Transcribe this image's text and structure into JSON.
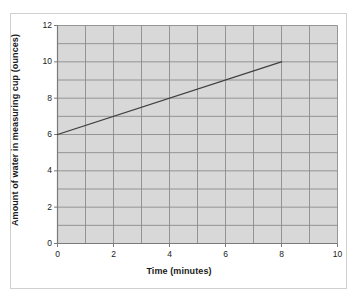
{
  "chart_data": {
    "type": "line",
    "title": "",
    "xlabel": "Time (minutes)",
    "ylabel": "Amount of water in measuring cup (ounces)",
    "xlim": [
      0,
      10
    ],
    "ylim": [
      0,
      12
    ],
    "x_ticks": [
      0,
      2,
      4,
      6,
      8,
      10
    ],
    "y_ticks": [
      0,
      2,
      4,
      6,
      8,
      10,
      12
    ],
    "x_tick_labels": [
      "0",
      "2",
      "4",
      "6",
      "8",
      "10"
    ],
    "y_tick_labels": [
      "0",
      "2",
      "4",
      "6",
      "8",
      "10",
      "12"
    ],
    "x_gridline_step": 1,
    "y_gridline_step": 1,
    "grid": true,
    "legend": "none",
    "series": [
      {
        "name": "Water in measuring cup",
        "x": [
          0,
          8
        ],
        "values": [
          6,
          10
        ],
        "points": [
          [
            0,
            6
          ],
          [
            1,
            6.5
          ],
          [
            2,
            7
          ],
          [
            3,
            7.5
          ],
          [
            4,
            8
          ],
          [
            5,
            8.5
          ],
          [
            6,
            9
          ],
          [
            7,
            9.5
          ],
          [
            8,
            10
          ]
        ],
        "slope": 0.5,
        "intercept": 6,
        "color": "#404040"
      }
    ],
    "colors": {
      "plot_background": "#d8d8d8",
      "gridline": "#8c8c8c",
      "axis": "#7a7a7a",
      "line": "#404040",
      "figure_background": "#ffffff",
      "frame_border": "#d0d0d0",
      "text": "#1a1a1a"
    }
  }
}
